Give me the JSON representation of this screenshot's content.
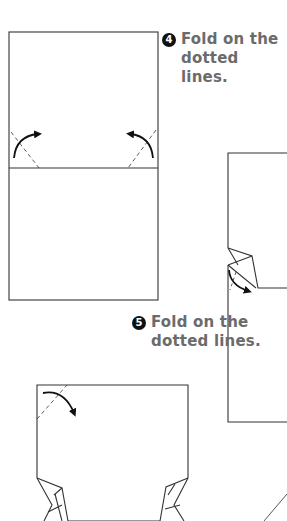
{
  "steps": [
    {
      "number": "4",
      "line1": "Fold on the",
      "line2": "dotted lines."
    },
    {
      "number": "5",
      "line1": "Fold on the",
      "line2": "dotted lines."
    }
  ],
  "colors": {
    "line": "#333333",
    "text": "#6b6b6b",
    "badge": "#111111",
    "background": "#ffffff"
  }
}
